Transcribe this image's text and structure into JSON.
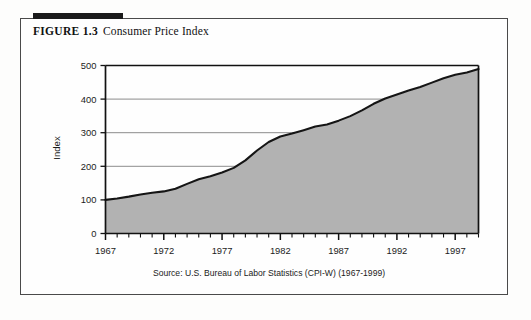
{
  "figure": {
    "number_label": "FIGURE 1.3",
    "caption": "Consumer Price Index"
  },
  "source_note": "Source: U.S. Bureau of Labor Statistics (CPI-W) (1967-1999)",
  "colors": {
    "area_fill": "#b2b2b2",
    "line": "#151515",
    "gridline": "#8c8c8c",
    "axis": "#111111",
    "frame": "#4a4a4a",
    "rule_bar": "#1a1a1a",
    "plot_background": "#ffffff"
  },
  "chart_data": {
    "type": "area",
    "title": "Consumer Price Index",
    "xlabel": "",
    "ylabel": "Index",
    "xlim": [
      1967,
      1999
    ],
    "ylim": [
      0,
      500
    ],
    "yticks": [
      0,
      100,
      200,
      300,
      400,
      500
    ],
    "ytick_labels": [
      "0",
      "100",
      "200",
      "300",
      "400",
      "500"
    ],
    "xticks_major": [
      1967,
      1972,
      1977,
      1982,
      1987,
      1992,
      1997
    ],
    "xtick_labels": [
      "1967",
      "1972",
      "1977",
      "1982",
      "1987",
      "1992",
      "1997"
    ],
    "xtick_minor_step": 1,
    "grid": "horizontal",
    "legend": "none",
    "series_name": "Consumer Price Index (CPI-W)",
    "x": [
      1967,
      1968,
      1969,
      1970,
      1971,
      1972,
      1973,
      1974,
      1975,
      1976,
      1977,
      1978,
      1979,
      1980,
      1981,
      1982,
      1983,
      1984,
      1985,
      1986,
      1987,
      1988,
      1989,
      1990,
      1991,
      1992,
      1993,
      1994,
      1995,
      1996,
      1997,
      1998,
      1999
    ],
    "values": [
      100.0,
      104.2,
      109.8,
      116.3,
      121.3,
      125.3,
      133.1,
      147.7,
      161.2,
      170.5,
      181.5,
      195.3,
      217.7,
      247.0,
      272.3,
      288.6,
      297.4,
      307.6,
      318.5,
      324.5,
      335.9,
      349.3,
      366.3,
      386.0,
      402.0,
      413.4,
      425.4,
      436.0,
      449.0,
      461.9,
      472.3,
      479.3,
      489.4
    ],
    "data_labels_shown": false,
    "annotations": []
  }
}
